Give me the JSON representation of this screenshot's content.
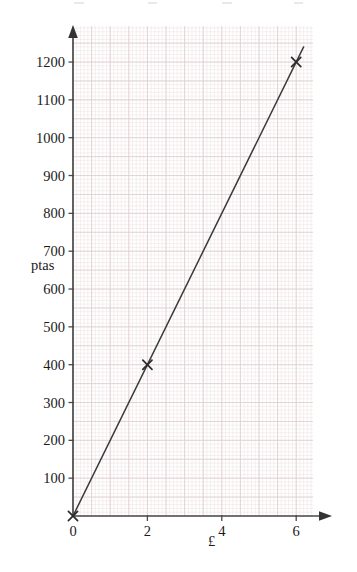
{
  "chart_data": {
    "type": "line",
    "title": "",
    "subtitle": "",
    "xlabel": "£",
    "ylabel": "ptas",
    "xlim": [
      0,
      6.6
    ],
    "ylim": [
      0,
      1290
    ],
    "grid": true,
    "grid_style": "graph-paper",
    "legend": "none",
    "x_ticks": [
      0,
      2,
      4,
      6
    ],
    "x_tick_labels": [
      "0",
      "2",
      "4",
      "6"
    ],
    "y_ticks": [
      0,
      100,
      200,
      300,
      400,
      500,
      600,
      700,
      800,
      900,
      1000,
      1100,
      1200
    ],
    "y_tick_labels": [
      "0",
      "100",
      "200",
      "300",
      "400",
      "500",
      "600",
      "700",
      "800",
      "900",
      "1000",
      "1100",
      "1200"
    ],
    "series": [
      {
        "name": "pounds to pesetas conversion",
        "x": [
          0,
          2,
          6
        ],
        "y": [
          0,
          400,
          1200
        ],
        "marker": "x",
        "line_x": [
          0,
          6.2
        ],
        "line_y": [
          0,
          1240
        ]
      }
    ],
    "annotations": [],
    "marker_points": [
      {
        "x": 0,
        "y": 0,
        "label": "(0, 0)"
      },
      {
        "x": 2,
        "y": 400,
        "label": "(2, 400)"
      },
      {
        "x": 6,
        "y": 1200,
        "label": "(6, 1200)"
      }
    ]
  },
  "axes": {
    "x_axis_name": "pounds-axis",
    "y_axis_name": "pesetas-axis",
    "x_title": "£",
    "y_title": "ptas"
  },
  "colors": {
    "line": "#3a3a3a",
    "marker": "#2b2b2b",
    "axis": "#4a4a4a",
    "grid_minor": "#f0e4e6",
    "grid_major": "#ded0d3",
    "background": "#ffffff",
    "text": "#1a1a1a"
  }
}
